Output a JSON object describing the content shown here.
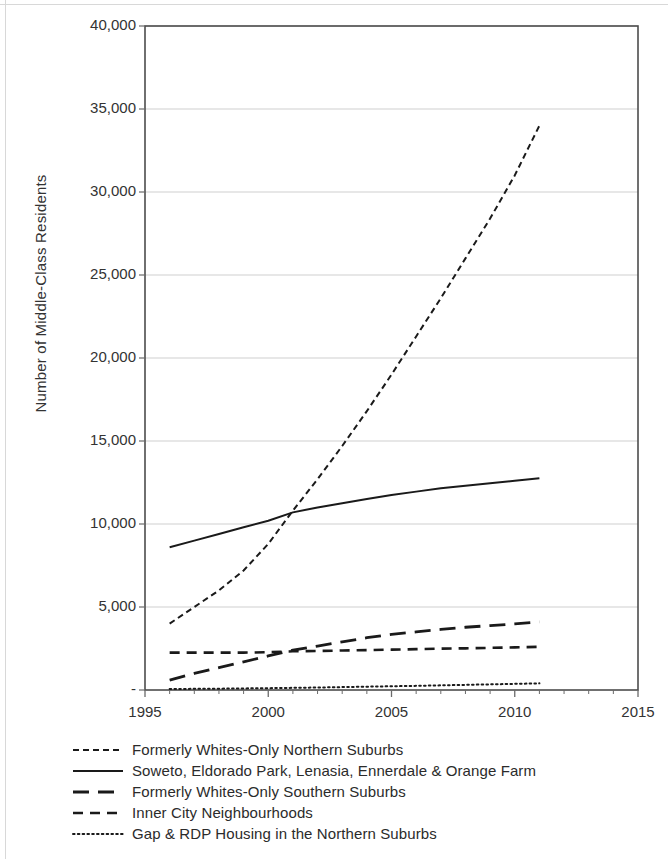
{
  "chart_data": {
    "type": "line",
    "title": "",
    "xlabel": "",
    "ylabel": "Number of Middle-Class Residents",
    "xlim": [
      1995,
      2015
    ],
    "ylim": [
      0,
      40000
    ],
    "xticks": [
      1995,
      2000,
      2005,
      2010,
      2015
    ],
    "xtick_labels": [
      "1995",
      "2000",
      "2005",
      "2010",
      "2015"
    ],
    "yticks": [
      0,
      5000,
      10000,
      15000,
      20000,
      25000,
      30000,
      35000,
      40000
    ],
    "ytick_labels": [
      "-",
      "5,000",
      "10,000",
      "15,000",
      "20,000",
      "25,000",
      "30,000",
      "35,000",
      "40,000"
    ],
    "grid": "horizontal",
    "legend_position": "below",
    "x": [
      1996,
      1997,
      1998,
      1999,
      2000,
      2001,
      2002,
      2003,
      2004,
      2005,
      2006,
      2007,
      2008,
      2009,
      2010,
      2011
    ],
    "series": [
      {
        "name": "Formerly Whites-Only Northern Suburbs",
        "style": "short-dash",
        "color": "#1a1a1a",
        "values": [
          4000,
          5000,
          6000,
          7200,
          8800,
          10800,
          12700,
          14700,
          16800,
          19000,
          21300,
          23600,
          26000,
          28400,
          31000,
          34000
        ]
      },
      {
        "name": "Soweto, Eldorado Park, Lenasia, Ennerdale & Orange Farm",
        "style": "solid",
        "color": "#1a1a1a",
        "values": [
          8600,
          9000,
          9400,
          9800,
          10200,
          10700,
          11000,
          11250,
          11500,
          11750,
          11950,
          12150,
          12300,
          12450,
          12600,
          12750
        ]
      },
      {
        "name": "Formerly Whites-Only Southern Suburbs",
        "style": "long-dash",
        "color": "#1a1a1a",
        "values": [
          600,
          1000,
          1350,
          1700,
          2050,
          2400,
          2650,
          2900,
          3150,
          3350,
          3500,
          3650,
          3780,
          3880,
          3980,
          4100
        ]
      },
      {
        "name": "Inner City Neighbourhoods",
        "style": "medium-dash",
        "color": "#1a1a1a",
        "values": [
          2250,
          2250,
          2250,
          2250,
          2280,
          2330,
          2350,
          2380,
          2400,
          2430,
          2460,
          2490,
          2510,
          2540,
          2570,
          2600
        ]
      },
      {
        "name": "Gap & RDP Housing in the Northern Suburbs",
        "style": "dotted",
        "color": "#1a1a1a",
        "values": [
          60,
          70,
          80,
          95,
          110,
          130,
          150,
          175,
          200,
          225,
          250,
          280,
          310,
          340,
          370,
          400
        ]
      }
    ]
  },
  "legend": {
    "items": [
      {
        "label": "Formerly Whites-Only Northern Suburbs",
        "style": "short-dash"
      },
      {
        "label": "Soweto, Eldorado Park, Lenasia, Ennerdale & Orange Farm",
        "style": "solid"
      },
      {
        "label": "Formerly Whites-Only Southern Suburbs",
        "style": "long-dash"
      },
      {
        "label": "Inner City Neighbourhoods",
        "style": "medium-dash"
      },
      {
        "label": "Gap & RDP Housing in the Northern Suburbs",
        "style": "dotted"
      }
    ]
  }
}
